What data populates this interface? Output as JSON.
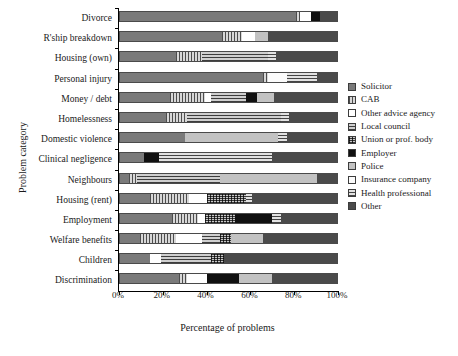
{
  "chart_data": {
    "type": "bar",
    "orientation": "horizontal",
    "stacked": true,
    "title": "",
    "xlabel": "Percentage of problems",
    "ylabel": "Problem category",
    "xlim": [
      0,
      100
    ],
    "xticks": [
      "0%",
      "20%",
      "40%",
      "60%",
      "80%",
      "100%"
    ],
    "xtick_values": [
      0,
      20,
      40,
      60,
      80,
      100
    ],
    "grid": false,
    "legend_position": "right",
    "categories": [
      "Divorce",
      "R'ship breakdown",
      "Housing (own)",
      "Personal injury",
      "Money / debt",
      "Homelessness",
      "Domestic violence",
      "Clinical negligence",
      "Neighbours",
      "Housing (rent)",
      "Employment",
      "Welfare benefits",
      "Children",
      "Discrimination"
    ],
    "series": [
      {
        "name": "Solicitor",
        "key": "solicitor",
        "values": [
          81,
          47,
          26,
          66,
          23,
          21,
          30,
          11,
          4,
          14,
          24,
          9,
          14,
          27
        ]
      },
      {
        "name": "CAB",
        "key": "cab",
        "values": [
          2,
          9,
          12,
          2,
          16,
          10,
          0,
          0,
          4,
          18,
          12,
          17,
          0,
          4
        ]
      },
      {
        "name": "Other advice agency",
        "key": "otheradvice",
        "values": [
          5,
          6,
          0,
          0,
          3,
          0,
          0,
          0,
          0,
          8,
          3,
          12,
          5,
          9
        ]
      },
      {
        "name": "Local council",
        "key": "localcouncil",
        "values": [
          0,
          0,
          30,
          0,
          16,
          43,
          0,
          0,
          38,
          0,
          0,
          8,
          23,
          0
        ]
      },
      {
        "name": "Union or prof. body",
        "key": "union",
        "values": [
          0,
          0,
          0,
          0,
          0,
          0,
          0,
          0,
          0,
          18,
          14,
          5,
          6,
          0
        ]
      },
      {
        "name": "Employer",
        "key": "employer",
        "values": [
          4,
          0,
          0,
          0,
          5,
          0,
          0,
          7,
          0,
          0,
          17,
          0,
          0,
          15
        ]
      },
      {
        "name": "Police",
        "key": "police",
        "values": [
          0,
          6,
          0,
          0,
          8,
          0,
          43,
          0,
          45,
          0,
          0,
          15,
          0,
          15
        ]
      },
      {
        "name": "Insurance company",
        "key": "insurance",
        "values": [
          0,
          0,
          0,
          9,
          0,
          0,
          0,
          0,
          0,
          0,
          0,
          0,
          0,
          0
        ]
      },
      {
        "name": "Health professional",
        "key": "health",
        "values": [
          0,
          0,
          4,
          14,
          0,
          4,
          4,
          52,
          0,
          3,
          4,
          0,
          0,
          0
        ]
      },
      {
        "name": "Other",
        "key": "other",
        "values": [
          8,
          32,
          28,
          9,
          29,
          22,
          23,
          30,
          9,
          39,
          26,
          34,
          52,
          30
        ]
      }
    ]
  }
}
